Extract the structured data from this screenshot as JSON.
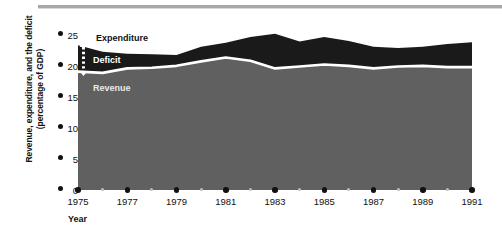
{
  "chart_data": {
    "type": "area",
    "title": "",
    "xlabel": "Year",
    "ylabel": "Revenue, expenditure, and the deficit (percentage of GDP)",
    "ylabel_line1": "Revenue, expenditure, and the deficit",
    "ylabel_line2": "(percentage of GDP)",
    "grid": false,
    "stacked": true,
    "legend_position": "inline",
    "xlim": [
      1975,
      1991
    ],
    "ylim": [
      0,
      25
    ],
    "yticks": [
      0,
      5,
      10,
      15,
      20,
      25
    ],
    "ytick_labels": [
      "0",
      "5",
      "10",
      "15",
      "20",
      "25"
    ],
    "xticks": [
      1975,
      1977,
      1979,
      1981,
      1983,
      1985,
      1987,
      1989,
      1991
    ],
    "xtick_labels": [
      "1975",
      "1977",
      "1979",
      "1981",
      "1983",
      "1985",
      "1987",
      "1989",
      "1991"
    ],
    "xminor_ticks": [
      1976,
      1978,
      1980,
      1982,
      1984,
      1986,
      1988,
      1990
    ],
    "x": [
      1975,
      1976,
      1977,
      1978,
      1979,
      1980,
      1981,
      1982,
      1983,
      1984,
      1985,
      1986,
      1987,
      1988,
      1989,
      1990,
      1991
    ],
    "series": [
      {
        "name": "Revenue",
        "color": "#606060",
        "label_color": "#e9e9e9",
        "values": [
          18.5,
          18.3,
          19.0,
          19.1,
          19.4,
          20.1,
          20.7,
          20.2,
          19.0,
          19.3,
          19.6,
          19.4,
          19.0,
          19.3,
          19.4,
          19.2,
          19.2
        ]
      },
      {
        "name": "Expenditure",
        "color": "#1a1a1a",
        "label_color": "#111111",
        "values": [
          22.6,
          21.6,
          21.3,
          21.2,
          21.1,
          22.4,
          23.0,
          23.9,
          24.4,
          23.2,
          23.9,
          23.3,
          22.4,
          22.2,
          22.4,
          22.8,
          23.1
        ]
      },
      {
        "name": "Deficit",
        "color": "#1a1a1a",
        "label_color": "#ffffff",
        "description": "Gap between expenditure and revenue",
        "values": [
          4.1,
          3.3,
          2.3,
          2.1,
          1.7,
          2.3,
          2.3,
          3.7,
          5.4,
          3.9,
          4.3,
          3.9,
          3.4,
          2.9,
          3.0,
          3.6,
          3.9
        ]
      }
    ],
    "inline_labels": [
      {
        "name": "Expenditure",
        "text": "Expenditure"
      },
      {
        "name": "Deficit",
        "text": "Deficit"
      },
      {
        "name": "Revenue",
        "text": "Revenue"
      }
    ],
    "annotations": [
      {
        "name": "deficit-gap-arrow",
        "type": "double-headed-dotted-arrow",
        "at_x": 1975,
        "color": "#ffffff"
      }
    ],
    "separator_line_color": "#ffffff",
    "background": "#ffffff"
  }
}
